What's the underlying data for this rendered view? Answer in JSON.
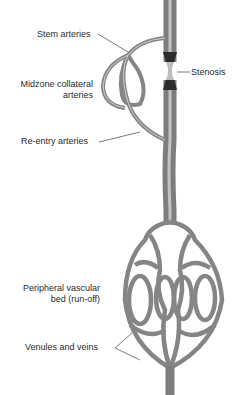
{
  "diagram": {
    "labels": {
      "stem_arteries": "Stem arteries",
      "midzone_line1": "Midzone collateral",
      "midzone_line2": "arteries",
      "reentry_arteries": "Re-entry arteries",
      "stenosis": "Stenosis",
      "peripheral_line1": "Peripheral vascular",
      "peripheral_line2": "bed (run-off)",
      "venules": "Venules and veins"
    },
    "colors": {
      "vessel": "#8c8c8c",
      "vessel_highlight": "#cfcfcf",
      "stenosis": "#2a2a2a",
      "leader": "#444444"
    }
  }
}
